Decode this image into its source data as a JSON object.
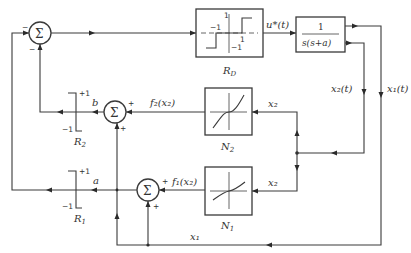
{
  "diagram": {
    "type": "control-system-block-diagram",
    "blocks": {
      "relay_main": {
        "label": "R_D",
        "sub": "D",
        "main": "R",
        "ticks": {
          "pos_y": "1",
          "neg_y": "−1",
          "neg_x": "−1",
          "pos_x": "1"
        }
      },
      "plant": {
        "numerator": "1",
        "denominator": "s(s+a)"
      },
      "nonlinear_2": {
        "main": "N",
        "sub": "2"
      },
      "nonlinear_1": {
        "main": "N",
        "sub": "1"
      },
      "relay_2": {
        "main": "R",
        "sub": "2",
        "plus": "+1",
        "minus": "−1"
      },
      "relay_1": {
        "main": "R",
        "sub": "1",
        "plus": "+1",
        "minus": "−1"
      }
    },
    "summers": {
      "main": {
        "symbol": "Σ",
        "sign_left": "−",
        "sign_bottom": "−"
      },
      "middle": {
        "symbol": "Σ",
        "sign_right": "+",
        "sign_bottom": "+"
      },
      "lower": {
        "symbol": "Σ",
        "sign_right": "+",
        "sign_bottom": "+"
      }
    },
    "signals": {
      "u_star": "u*(t)",
      "x2_t": "x₂(t)",
      "x1_t": "x₁(t)",
      "x2_to_n2": "x₂",
      "x2_to_n1": "x₂",
      "f2": "f₂(x₂)",
      "f1": "f₁(x₂)",
      "b": "b",
      "a": "a",
      "x1_bottom": "x₁"
    }
  }
}
